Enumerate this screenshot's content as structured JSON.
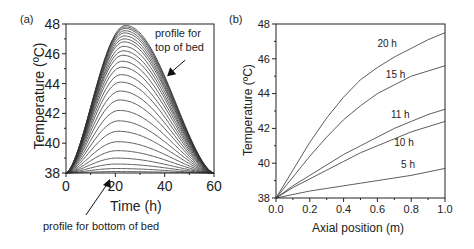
{
  "chart_data": [
    {
      "panel_label": "(a)",
      "type": "line",
      "title": "",
      "xlabel": "Time (h)",
      "ylabel": "Temperature (ºC)",
      "xlim": [
        0,
        60
      ],
      "ylim": [
        38,
        48
      ],
      "xticks": [
        "0",
        "20",
        "40",
        "60"
      ],
      "yticks": [
        "38",
        "40",
        "42",
        "44",
        "46",
        "48"
      ],
      "grid": false,
      "description": "Family of ~26 bell-shaped temperature profiles at successive bed heights; all start at 38 °C at t=0 and return to ~38 °C at t=60 h. Peak grows from bottom to top of bed, peak time shifts from ~20 h to ~24 h.",
      "series_peaks": [
        38.1,
        38.3,
        38.6,
        39.0,
        39.5,
        40.1,
        40.8,
        41.5,
        42.2,
        42.9,
        43.5,
        44.1,
        44.6,
        45.1,
        45.5,
        45.9,
        46.2,
        46.5,
        46.8,
        47.0,
        47.2,
        47.4,
        47.55,
        47.7,
        47.8,
        47.9
      ],
      "series_peak_times": [
        20,
        20.2,
        20.4,
        20.6,
        20.8,
        21,
        21.2,
        21.4,
        21.6,
        21.8,
        22,
        22.2,
        22.4,
        22.6,
        22.8,
        23,
        23.2,
        23.4,
        23.5,
        23.6,
        23.7,
        23.8,
        23.9,
        24,
        24.1,
        24.2
      ],
      "annotations": [
        {
          "text_lines": [
            "profile for",
            "top of bed"
          ],
          "arrow_to": [
            41,
            44.5
          ]
        },
        {
          "text": "profile for bottom of bed",
          "arrow_to": [
            17,
            38
          ]
        }
      ]
    },
    {
      "panel_label": "(b)",
      "type": "line",
      "title": "",
      "xlabel": "Axial position (m)",
      "ylabel": "Temperature (ºC)",
      "xlim": [
        0.0,
        1.0
      ],
      "ylim": [
        38,
        48
      ],
      "xticks": [
        "0.0",
        "0.2",
        "0.4",
        "0.6",
        "0.8",
        "1.0"
      ],
      "yticks": [
        "38",
        "40",
        "42",
        "44",
        "46",
        "48"
      ],
      "grid": false,
      "x": [
        0.0,
        0.1,
        0.2,
        0.3,
        0.4,
        0.5,
        0.6,
        0.7,
        0.8,
        0.9,
        1.0
      ],
      "series": [
        {
          "name": "20 h",
          "values": [
            38.0,
            39.6,
            41.2,
            42.6,
            43.8,
            44.8,
            45.5,
            46.1,
            46.6,
            47.1,
            47.5
          ]
        },
        {
          "name": "15 h",
          "values": [
            38.0,
            39.2,
            40.4,
            41.5,
            42.5,
            43.3,
            44.0,
            44.5,
            45.0,
            45.3,
            45.6
          ]
        },
        {
          "name": "11 h",
          "values": [
            38.0,
            38.7,
            39.3,
            39.9,
            40.5,
            41.0,
            41.5,
            42.0,
            42.4,
            42.8,
            43.1
          ]
        },
        {
          "name": "10 h",
          "values": [
            38.0,
            38.6,
            39.1,
            39.6,
            40.1,
            40.6,
            41.0,
            41.4,
            41.8,
            42.1,
            42.4
          ]
        },
        {
          "name": "5 h",
          "values": [
            38.0,
            38.2,
            38.4,
            38.55,
            38.7,
            38.85,
            39.0,
            39.15,
            39.3,
            39.5,
            39.7
          ]
        }
      ],
      "label_positions": [
        {
          "name": "20 h",
          "x": 0.6,
          "y": 46.7
        },
        {
          "name": "15 h",
          "x": 0.65,
          "y": 44.9
        },
        {
          "name": "11 h",
          "x": 0.68,
          "y": 42.6
        },
        {
          "name": "10 h",
          "x": 0.7,
          "y": 41.0
        },
        {
          "name": "5 h",
          "x": 0.74,
          "y": 39.7
        }
      ]
    }
  ],
  "panels": {
    "a": {
      "label": "(a)",
      "xlabel": "Time (h)",
      "ylabel": "Temperature (ºC)",
      "annotation_top_1": "profile for",
      "annotation_top_2": "top of bed",
      "annotation_bottom": "profile for bottom of bed"
    },
    "b": {
      "label": "(b)",
      "xlabel": "Axial position (m)",
      "ylabel": "Temperature (ºC)"
    }
  }
}
